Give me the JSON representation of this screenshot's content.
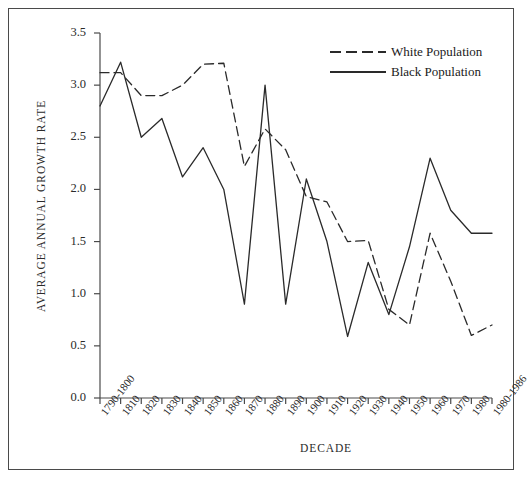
{
  "chart_data": {
    "type": "line",
    "title": "",
    "xlabel": "DECADE",
    "ylabel": "AVERAGE ANNUAL GROWTH RATE",
    "ylim": [
      0.0,
      3.5
    ],
    "yticks": [
      "0.0",
      "0.5",
      "1.0",
      "1.5",
      "2.0",
      "2.5",
      "3.0",
      "3.5"
    ],
    "ytick_values": [
      0.0,
      0.5,
      1.0,
      1.5,
      2.0,
      2.5,
      3.0,
      3.5
    ],
    "grid": false,
    "legend_position": "top-right",
    "categories": [
      "1790-1800",
      "1810",
      "1820",
      "1830",
      "1840",
      "1850",
      "1860",
      "1870",
      "1880",
      "1890",
      "1900",
      "1910",
      "1920",
      "1930",
      "1940",
      "1950",
      "1960",
      "1970",
      "1980",
      "1980-1986"
    ],
    "series": [
      {
        "name": "White Population",
        "style": "dashed",
        "color": "#2a2a2a",
        "values": [
          3.12,
          3.12,
          2.9,
          2.9,
          3.0,
          3.2,
          3.21,
          2.22,
          2.58,
          2.38,
          1.93,
          1.88,
          1.5,
          1.51,
          0.85,
          0.7,
          1.58,
          1.12,
          0.6,
          0.7
        ]
      },
      {
        "name": "Black Population",
        "style": "solid",
        "color": "#2a2a2a",
        "values": [
          2.8,
          3.22,
          2.5,
          2.68,
          2.12,
          2.4,
          2.0,
          0.9,
          3.0,
          0.9,
          2.1,
          1.5,
          0.59,
          1.3,
          0.8,
          1.45,
          2.3,
          1.8,
          1.58,
          1.58
        ]
      }
    ]
  },
  "legend": {
    "entries": [
      {
        "label": "White Population",
        "style": "dashed"
      },
      {
        "label": "Black Population",
        "style": "solid"
      }
    ]
  },
  "axes": {
    "x_title": "DECADE",
    "y_title": "AVERAGE ANNUAL GROWTH RATE"
  }
}
